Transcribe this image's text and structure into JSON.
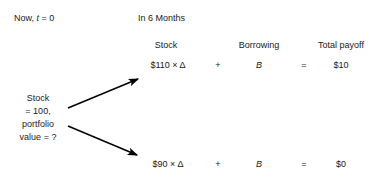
{
  "figure": {
    "timeline": {
      "now_label": "Now, ",
      "now_var": "t",
      "now_value": " = 0",
      "future_label": "In 6 Months"
    },
    "columns": [
      {
        "name": "stock",
        "header": "Stock"
      },
      {
        "name": "borrowing",
        "header": "Borrowing"
      },
      {
        "name": "total-payoff",
        "header": "Total payoff"
      }
    ],
    "node": {
      "lines": [
        "Stock",
        "= 100,",
        "portfolio",
        "value = ?"
      ]
    },
    "branches": [
      {
        "name": "up",
        "stock": "$110 × Δ",
        "plus": "+",
        "borrowing": "B",
        "equals": "=",
        "total": "$10"
      },
      {
        "name": "down",
        "stock": "$90 × Δ",
        "plus": "+",
        "borrowing": "B",
        "equals": "=",
        "total": "$0"
      }
    ],
    "colors": {
      "text": "#1a1a1a",
      "arrow": "#000000",
      "background": "#ffffff"
    }
  }
}
